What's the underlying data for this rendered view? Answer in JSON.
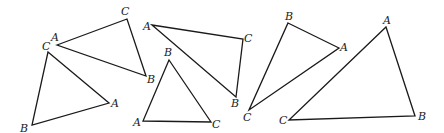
{
  "diagram": {
    "triangles": [
      {
        "id": "t1",
        "vertices": [
          {
            "label": "A",
            "x": 57,
            "y": 45,
            "lx": 51,
            "ly": 41
          },
          {
            "label": "C",
            "x": 127,
            "y": 19,
            "lx": 121,
            "ly": 15
          },
          {
            "label": "B",
            "x": 146,
            "y": 76,
            "lx": 147,
            "ly": 83
          }
        ]
      },
      {
        "id": "t2",
        "vertices": [
          {
            "label": "C",
            "x": 48,
            "y": 52,
            "lx": 42,
            "ly": 50
          },
          {
            "label": "A",
            "x": 109,
            "y": 103,
            "lx": 111,
            "ly": 107
          },
          {
            "label": "B",
            "x": 32,
            "y": 125,
            "lx": 20,
            "ly": 132
          }
        ]
      },
      {
        "id": "t3",
        "vertices": [
          {
            "label": "A",
            "x": 152,
            "y": 25,
            "lx": 143,
            "ly": 30
          },
          {
            "label": "C",
            "x": 243,
            "y": 39,
            "lx": 244,
            "ly": 42
          },
          {
            "label": "B",
            "x": 236,
            "y": 97,
            "lx": 231,
            "ly": 107
          }
        ]
      },
      {
        "id": "t4",
        "vertices": [
          {
            "label": "B",
            "x": 169,
            "y": 60,
            "lx": 164,
            "ly": 56
          },
          {
            "label": "A",
            "x": 143,
            "y": 121,
            "lx": 133,
            "ly": 126
          },
          {
            "label": "C",
            "x": 211,
            "y": 122,
            "lx": 212,
            "ly": 128
          }
        ]
      },
      {
        "id": "t5",
        "vertices": [
          {
            "label": "B",
            "x": 288,
            "y": 23,
            "lx": 285,
            "ly": 20
          },
          {
            "label": "A",
            "x": 339,
            "y": 48,
            "lx": 340,
            "ly": 51
          },
          {
            "label": "C",
            "x": 249,
            "y": 110,
            "lx": 243,
            "ly": 121
          }
        ]
      },
      {
        "id": "t6",
        "vertices": [
          {
            "label": "A",
            "x": 386,
            "y": 27,
            "lx": 383,
            "ly": 24
          },
          {
            "label": "B",
            "x": 415,
            "y": 116,
            "lx": 418,
            "ly": 120
          },
          {
            "label": "C",
            "x": 289,
            "y": 120,
            "lx": 279,
            "ly": 124
          }
        ]
      }
    ]
  }
}
